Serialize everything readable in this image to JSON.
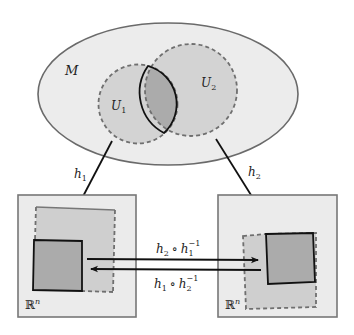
{
  "diagram": {
    "manifold_label": "M",
    "open_sets": [
      {
        "label": "U",
        "sub": "1"
      },
      {
        "label": "U",
        "sub": "2"
      }
    ],
    "charts": [
      {
        "label": "h",
        "sub": "1"
      },
      {
        "label": "h",
        "sub": "2"
      }
    ],
    "euclidean_label": "ℝ",
    "euclidean_sup": "n",
    "transition_maps": [
      {
        "f": "h",
        "f_sub": "2",
        "op": "∘",
        "g": "h",
        "g_sub": "1",
        "g_sup": "−1"
      },
      {
        "f": "h",
        "f_sub": "1",
        "op": "∘",
        "g": "h",
        "g_sub": "2",
        "g_sup": "−1"
      }
    ],
    "colors": {
      "manifold_fill": "#ececec",
      "manifold_stroke": "#6a6a6a",
      "open_set_fill": "#cfcfcf",
      "overlap_fill": "#aaaaaa",
      "dashed_stroke": "#6f6f6f",
      "box_fill": "#ebebeb",
      "box_stroke": "#777777",
      "arrow": "#111111"
    }
  }
}
